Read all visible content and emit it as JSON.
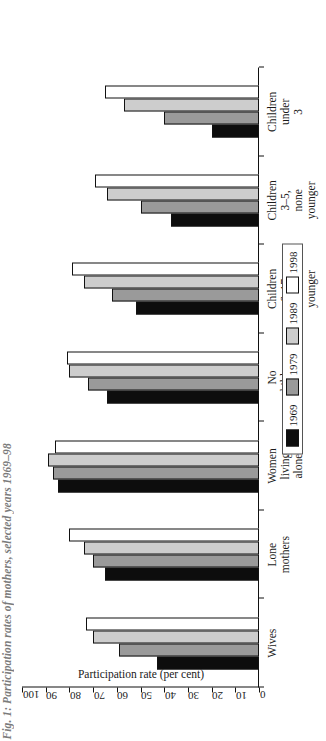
{
  "figure": {
    "title": "Fig. 1: Participation rates of mothers, selected years 1969–98"
  },
  "legend": {
    "position": "bottom-right",
    "items": [
      {
        "label": "1969",
        "color": "#0d0d0d"
      },
      {
        "label": "1979",
        "color": "#9a9a9a"
      },
      {
        "label": "1989",
        "color": "#cdcdcd"
      },
      {
        "label": "1998",
        "color": "#ffffff"
      }
    ]
  },
  "axes": {
    "ylabel": "Participation rate (per cent)",
    "yticks": [
      "0",
      "10",
      "20",
      "30",
      "40",
      "50",
      "60",
      "70",
      "80",
      "90",
      "100"
    ]
  },
  "chart_data": {
    "type": "bar",
    "orientation": "horizontal-rotated",
    "title": "Fig. 1: Participation rates of mothers, selected years 1969–98",
    "xlabel": "",
    "ylabel": "Participation rate (per cent)",
    "ylim": [
      0,
      100
    ],
    "grid": false,
    "legend_position": "bottom-right",
    "categories": [
      "Wives",
      "Lone mothers",
      "Women living\nalone",
      "No children\nunder 18",
      "Children 6–17,\nnone younger",
      "Children 3–5,\nnone younger",
      "Children under\n3"
    ],
    "series": [
      {
        "name": "1969",
        "color": "#0d0d0d",
        "values": [
          43,
          65,
          85,
          64,
          52,
          37,
          20
        ]
      },
      {
        "name": "1979",
        "color": "#9a9a9a",
        "values": [
          59,
          70,
          87,
          72,
          62,
          50,
          40
        ]
      },
      {
        "name": "1989",
        "color": "#cdcdcd",
        "values": [
          70,
          74,
          89,
          80,
          74,
          64,
          57
        ]
      },
      {
        "name": "1998",
        "color": "#ffffff",
        "values": [
          73,
          80,
          86,
          81,
          79,
          69,
          65
        ]
      }
    ]
  }
}
